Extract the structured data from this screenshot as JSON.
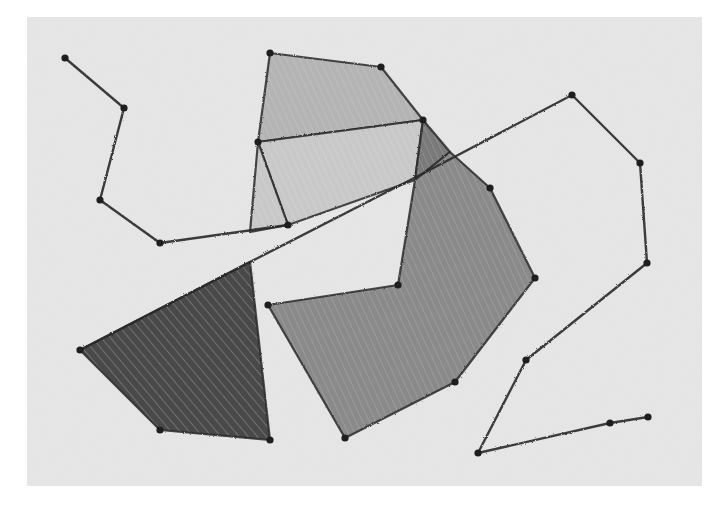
{
  "artwork": {
    "title": "Crayon geometric drawing",
    "medium": "grayscale crayon on textured paper",
    "colors": {
      "page_background": "#ffffff",
      "paper": "#e6e6e6",
      "line": "#2a2a2a",
      "fill_light": "#b4b4b4",
      "fill_lighter": "#c8c8c8",
      "fill_mid": "#8a8a8a",
      "fill_mid_dark": "#7a7a7a",
      "fill_dark": "#4a4a4a"
    },
    "paper_rect": {
      "x": 27,
      "y": 17,
      "width": 675,
      "height": 469
    },
    "polylines": [
      {
        "name": "left-path",
        "points": [
          [
            65,
            58
          ],
          [
            124,
            108
          ],
          [
            100,
            200
          ],
          [
            160,
            243
          ],
          [
            288,
            225
          ]
        ]
      },
      {
        "name": "long-diagonal",
        "points": [
          [
            80,
            350
          ],
          [
            250,
            262
          ],
          [
            420,
            175
          ],
          [
            572,
            95
          ]
        ]
      },
      {
        "name": "right-path",
        "points": [
          [
            572,
            95
          ],
          [
            640,
            163
          ],
          [
            647,
            263
          ],
          [
            526,
            360
          ],
          [
            478,
            453
          ],
          [
            610,
            423
          ],
          [
            648,
            417
          ]
        ]
      }
    ],
    "polygons": [
      {
        "name": "top-quad",
        "fill": "fill_light",
        "points": [
          [
            270,
            53
          ],
          [
            381,
            67
          ],
          [
            423,
            120
          ],
          [
            258,
            142
          ]
        ]
      },
      {
        "name": "middle-quad",
        "fill": "fill_lighter",
        "points": [
          [
            258,
            142
          ],
          [
            423,
            120
          ],
          [
            415,
            180
          ],
          [
            288,
            225
          ]
        ]
      },
      {
        "name": "thin-sliver",
        "fill": "fill_lighter",
        "points": [
          [
            258,
            142
          ],
          [
            288,
            225
          ],
          [
            250,
            232
          ]
        ]
      },
      {
        "name": "small-dark-wedge",
        "fill": "fill_mid_dark",
        "points": [
          [
            423,
            120
          ],
          [
            450,
            152
          ],
          [
            415,
            180
          ]
        ]
      },
      {
        "name": "large-gray-polygon",
        "fill": "fill_mid",
        "points": [
          [
            450,
            152
          ],
          [
            490,
            188
          ],
          [
            535,
            278
          ],
          [
            455,
            382
          ],
          [
            345,
            438
          ],
          [
            268,
            305
          ],
          [
            398,
            285
          ],
          [
            415,
            180
          ]
        ]
      },
      {
        "name": "dark-triangle",
        "fill": "fill_dark",
        "points": [
          [
            80,
            350
          ],
          [
            250,
            262
          ],
          [
            270,
            440
          ],
          [
            160,
            430
          ]
        ]
      }
    ],
    "vertex_dots": [
      [
        65,
        58
      ],
      [
        124,
        108
      ],
      [
        100,
        200
      ],
      [
        160,
        243
      ],
      [
        270,
        53
      ],
      [
        381,
        67
      ],
      [
        423,
        120
      ],
      [
        258,
        142
      ],
      [
        288,
        225
      ],
      [
        490,
        188
      ],
      [
        535,
        278
      ],
      [
        455,
        382
      ],
      [
        345,
        438
      ],
      [
        268,
        305
      ],
      [
        398,
        285
      ],
      [
        80,
        350
      ],
      [
        160,
        430
      ],
      [
        270,
        440
      ],
      [
        572,
        95
      ],
      [
        640,
        163
      ],
      [
        647,
        263
      ],
      [
        526,
        360
      ],
      [
        478,
        453
      ],
      [
        610,
        423
      ],
      [
        648,
        417
      ]
    ]
  }
}
